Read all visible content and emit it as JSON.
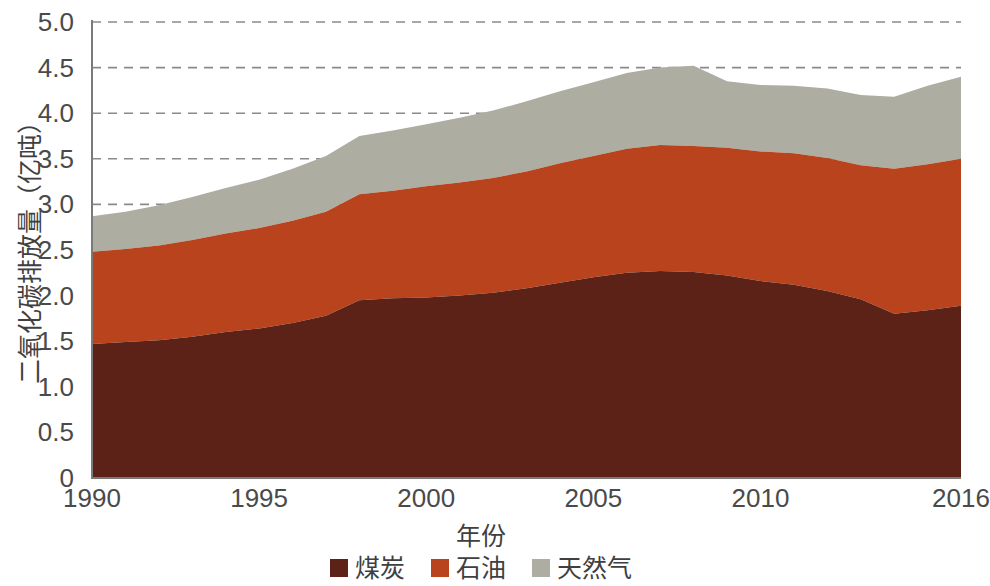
{
  "chart_data": {
    "type": "area",
    "stacked": true,
    "title": "",
    "xlabel": "年份",
    "ylabel": "二氧化碳排放量（亿吨）",
    "xlim": [
      1990,
      2016
    ],
    "ylim": [
      0,
      5.0
    ],
    "grid": "horizontal dashed gridlines at 3.0, 3.5, 4.0, 4.5, 5.0",
    "legend_position": "bottom-center",
    "x_tick_labels": [
      "1990",
      "1995",
      "2000",
      "2005",
      "2010",
      "2016"
    ],
    "x_tick_values": [
      1990,
      1995,
      2000,
      2005,
      2010,
      2016
    ],
    "y_tick_labels": [
      "0",
      "0.5",
      "1.0",
      "1.5",
      "2.0",
      "2.5",
      "3.0",
      "3.5",
      "4.0",
      "4.5",
      "5.0"
    ],
    "y_tick_values": [
      0,
      0.5,
      1.0,
      1.5,
      2.0,
      2.5,
      3.0,
      3.5,
      4.0,
      4.5,
      5.0
    ],
    "gridline_values": [
      3.0,
      3.5,
      4.0,
      4.5,
      5.0
    ],
    "x": [
      1990,
      1991,
      1992,
      1993,
      1994,
      1995,
      1996,
      1997,
      1998,
      1999,
      2000,
      2001,
      2002,
      2003,
      2004,
      2005,
      2006,
      2007,
      2008,
      2009,
      2010,
      2011,
      2012,
      2013,
      2014,
      2015,
      2016
    ],
    "series": [
      {
        "name": "煤炭",
        "color": "#5C2217",
        "values": [
          1.47,
          1.49,
          1.51,
          1.55,
          1.6,
          1.64,
          1.7,
          1.78,
          1.95,
          1.97,
          1.98,
          2.0,
          2.03,
          2.08,
          2.14,
          2.2,
          2.25,
          2.27,
          2.26,
          2.22,
          2.16,
          2.12,
          2.05,
          1.96,
          1.8,
          1.84,
          1.89
        ]
      },
      {
        "name": "石油",
        "color": "#B8431C",
        "values": [
          1.01,
          1.02,
          1.04,
          1.06,
          1.08,
          1.1,
          1.12,
          1.14,
          1.16,
          1.18,
          1.22,
          1.24,
          1.26,
          1.28,
          1.31,
          1.33,
          1.36,
          1.38,
          1.38,
          1.4,
          1.42,
          1.44,
          1.46,
          1.47,
          1.59,
          1.6,
          1.61
        ]
      },
      {
        "name": "天然气",
        "color": "#ADADA2",
        "values": [
          0.39,
          0.41,
          0.44,
          0.47,
          0.5,
          0.53,
          0.57,
          0.61,
          0.64,
          0.66,
          0.68,
          0.71,
          0.74,
          0.77,
          0.79,
          0.81,
          0.83,
          0.85,
          0.88,
          0.73,
          0.73,
          0.74,
          0.76,
          0.77,
          0.79,
          0.86,
          0.9
        ]
      }
    ],
    "totals": [
      2.87,
      2.92,
      2.99,
      3.08,
      3.18,
      3.27,
      3.39,
      3.53,
      3.75,
      3.81,
      3.88,
      3.95,
      4.03,
      4.13,
      4.24,
      4.34,
      4.44,
      4.5,
      4.52,
      4.35,
      4.31,
      4.3,
      4.27,
      4.2,
      4.18,
      4.3,
      4.4
    ]
  },
  "legend": {
    "items": [
      {
        "label": "煤炭",
        "color": "#5C2217"
      },
      {
        "label": "石油",
        "color": "#B8431C"
      },
      {
        "label": "天然气",
        "color": "#ADADA2"
      }
    ]
  }
}
